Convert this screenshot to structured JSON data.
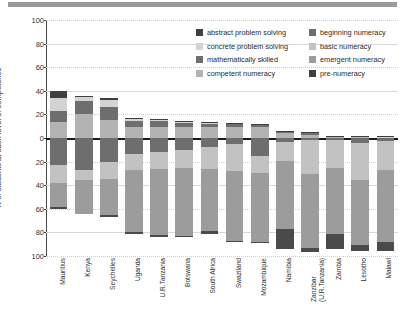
{
  "chart_data": {
    "type": "bar",
    "orientation": "vertical-diverging-stacked",
    "title": "",
    "xlabel": "",
    "ylabel": "% of students at each level of competence",
    "ylim": [
      -100,
      100
    ],
    "yticks": [
      100,
      80,
      60,
      40,
      20,
      0,
      20,
      40,
      60,
      80,
      100
    ],
    "ytick_values": [
      100,
      80,
      60,
      40,
      20,
      0,
      -20,
      -40,
      -60,
      -80,
      -100
    ],
    "grid": true,
    "legend_position": "top-right",
    "categories": [
      "Mauritius",
      "Kenya",
      "Seychelles",
      "Uganda",
      "U.R.Tanzania",
      "Botswana",
      "South Africa",
      "Swaziland",
      "Mozambique",
      "Namibia",
      "Zanzibar (U.R.Tanzania)",
      "Zambia",
      "Lesotho",
      "Malawi"
    ],
    "category_lines": [
      [
        "Mauritius"
      ],
      [
        "Kenya"
      ],
      [
        "Seychelles"
      ],
      [
        "Uganda"
      ],
      [
        "U.R.Tanzania"
      ],
      [
        "Botswana"
      ],
      [
        "South Africa"
      ],
      [
        "Swaziland"
      ],
      [
        "Mozambique"
      ],
      [
        "Namibia"
      ],
      [
        "Zanzibar",
        "(U.R.Tanzania)"
      ],
      [
        "Zambia"
      ],
      [
        "Lesotho"
      ],
      [
        "Malawi"
      ]
    ],
    "series": [
      {
        "name": "abstract problem solving",
        "color": "#3f3f3f",
        "direction": "up",
        "values": [
          6.0,
          1.0,
          1.0,
          0.5,
          0.4,
          0.3,
          0.3,
          0.2,
          0.2,
          0.2,
          0.2,
          0.1,
          0.1,
          0.1
        ]
      },
      {
        "name": "concrete problem solving",
        "color": "#d3d3d3",
        "direction": "up",
        "values": [
          10.5,
          3.5,
          6.5,
          2.0,
          1.5,
          1.0,
          1.0,
          0.8,
          0.5,
          0.3,
          0.4,
          0.2,
          0.2,
          0.2
        ]
      },
      {
        "name": "mathematically skilled",
        "color": "#6e6e6e",
        "direction": "up",
        "values": [
          9.5,
          11.0,
          11.0,
          5.0,
          5.0,
          4.0,
          3.0,
          2.5,
          2.0,
          1.5,
          2.0,
          0.8,
          0.6,
          0.4
        ]
      },
      {
        "name": "competent numeracy",
        "color": "#b3b3b3",
        "direction": "up",
        "values": [
          13.5,
          20.0,
          15.0,
          9.5,
          9.0,
          9.0,
          9.0,
          9.5,
          9.5,
          4.0,
          2.5,
          1.0,
          1.0,
          0.6
        ]
      },
      {
        "name": "beginning numeracy",
        "color": "#6e6e6e",
        "direction": "down",
        "values": [
          22.5,
          27.0,
          20.0,
          13.5,
          11.5,
          10.0,
          7.5,
          5.5,
          15.0,
          3.5,
          2.0,
          1.5,
          4.0,
          2.5
        ]
      },
      {
        "name": "basic numeracy",
        "color": "#c2c2c2",
        "direction": "down",
        "values": [
          16.0,
          9.0,
          15.0,
          13.5,
          15.0,
          15.5,
          18.5,
          22.5,
          15.0,
          16.0,
          28.5,
          24.0,
          31.5,
          24.5
        ]
      },
      {
        "name": "emergent numeracy",
        "color": "#9c9c9c",
        "direction": "down",
        "values": [
          20.0,
          28.0,
          30.0,
          53.0,
          55.5,
          57.5,
          53.0,
          59.0,
          58.0,
          58.0,
          63.0,
          55.5,
          55.0,
          61.0
        ]
      },
      {
        "name": "pre-numeracy",
        "color": "#4a4a4a",
        "direction": "down",
        "values": [
          2.0,
          0.0,
          2.0,
          1.5,
          1.5,
          1.0,
          2.5,
          0.5,
          0.5,
          16.5,
          3.0,
          13.0,
          5.5,
          7.5
        ]
      }
    ]
  },
  "legend": {
    "left_column": [
      {
        "label": "abstract problem solving",
        "color": "#3f3f3f"
      },
      {
        "label": "concrete problem solving",
        "color": "#d3d3d3"
      },
      {
        "label": "mathematically skilled",
        "color": "#6e6e6e"
      },
      {
        "label": "competent numeracy",
        "color": "#b3b3b3"
      }
    ],
    "right_column": [
      {
        "label": "beginning numeracy",
        "color": "#6e6e6e"
      },
      {
        "label": "basic numeracy",
        "color": "#c2c2c2"
      },
      {
        "label": "emergent numeracy",
        "color": "#9c9c9c"
      },
      {
        "label": "pre-numeracy",
        "color": "#3f3f3f"
      }
    ]
  }
}
